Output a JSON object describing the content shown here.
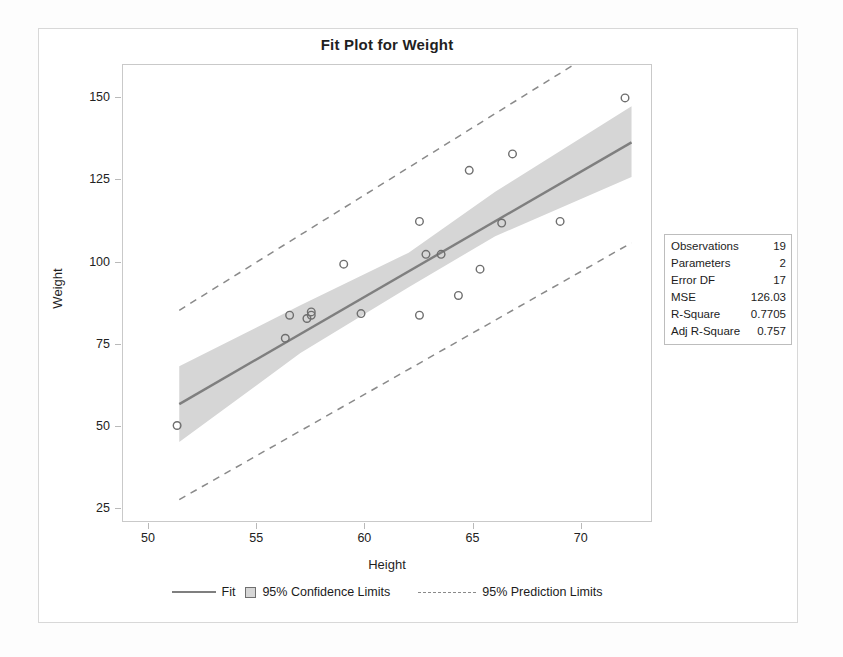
{
  "chart_data": {
    "type": "scatter",
    "title": "Fit Plot for Weight",
    "xlabel": "Height",
    "ylabel": "Weight",
    "xlim": [
      48.8,
      73.2
    ],
    "ylim": [
      21.5,
      160.0
    ],
    "xticks": [
      50,
      55,
      60,
      65,
      70
    ],
    "yticks": [
      25,
      50,
      75,
      100,
      125,
      150
    ],
    "grid": false,
    "legend_position": "bottom",
    "points": [
      {
        "x": 51.3,
        "y": 50.5
      },
      {
        "x": 56.3,
        "y": 77.0
      },
      {
        "x": 56.5,
        "y": 84.0
      },
      {
        "x": 57.3,
        "y": 83.0
      },
      {
        "x": 57.5,
        "y": 85.0
      },
      {
        "x": 57.5,
        "y": 84.0
      },
      {
        "x": 59.0,
        "y": 99.5
      },
      {
        "x": 59.8,
        "y": 84.5
      },
      {
        "x": 62.5,
        "y": 112.5
      },
      {
        "x": 62.5,
        "y": 84.0
      },
      {
        "x": 62.8,
        "y": 102.5
      },
      {
        "x": 63.5,
        "y": 102.5
      },
      {
        "x": 64.3,
        "y": 90.0
      },
      {
        "x": 64.8,
        "y": 128.0
      },
      {
        "x": 65.3,
        "y": 98.0
      },
      {
        "x": 66.3,
        "y": 112.0
      },
      {
        "x": 66.8,
        "y": 133.0
      },
      {
        "x": 69.0,
        "y": 112.5
      },
      {
        "x": 72.0,
        "y": 150.0
      }
    ],
    "fit_line": {
      "name": "Fit",
      "x": [
        51.4,
        72.3
      ],
      "y": [
        57.0,
        136.5
      ]
    },
    "confidence_band": {
      "name": "95% Confidence Limits",
      "level": 95,
      "x": [
        51.4,
        57.0,
        62.0,
        66.0,
        72.3
      ],
      "lower": [
        45.5,
        72.5,
        92.5,
        108.0,
        126.0
      ],
      "upper": [
        68.5,
        87.0,
        103.0,
        121.5,
        147.5
      ]
    },
    "prediction_limits": {
      "name": "95% Prediction Limits",
      "level": 95,
      "x": [
        51.4,
        72.3
      ],
      "lower": [
        28.0,
        106.0
      ],
      "upper": [
        85.5,
        171.0
      ]
    },
    "colors": {
      "fit_line": "#7f7f7f",
      "confidence_band": "#d6d6d6",
      "prediction_limit": "#8a8a8a",
      "marker_stroke": "#6e6e6e",
      "frame": "#c9c9c9",
      "card_border": "#d8d8d8"
    }
  },
  "statistics": {
    "rows": [
      {
        "label": "Observations",
        "value": "19"
      },
      {
        "label": "Parameters",
        "value": "2"
      },
      {
        "label": "Error DF",
        "value": "17"
      },
      {
        "label": "MSE",
        "value": "126.03"
      },
      {
        "label": "R-Square",
        "value": "0.7705"
      },
      {
        "label": "Adj R-Square",
        "value": "0.757"
      }
    ]
  },
  "legend": {
    "fit_label": "Fit",
    "confidence_label": "95% Confidence Limits",
    "prediction_label": "95% Prediction Limits"
  },
  "axes": {
    "x_label": "Height",
    "y_label": "Weight",
    "x_ticks": [
      "50",
      "55",
      "60",
      "65",
      "70"
    ],
    "y_ticks": [
      "150",
      "125",
      "100",
      "75",
      "50",
      "25"
    ]
  }
}
